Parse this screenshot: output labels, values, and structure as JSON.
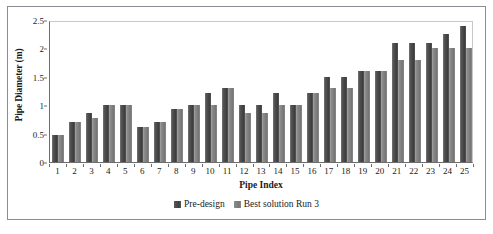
{
  "chart_data": {
    "type": "bar",
    "title": "",
    "xlabel": "Pipe Index",
    "ylabel": "Pipe Diameter (m)",
    "ylim": [
      0,
      2.5
    ],
    "yticks": [
      0,
      0.5,
      1,
      1.5,
      2,
      2.5
    ],
    "ytick_labels": [
      "0",
      "0.5",
      "1",
      "1.5",
      "2",
      "2.5"
    ],
    "grid": false,
    "legend_position": "bottom",
    "categories": [
      "1",
      "2",
      "3",
      "4",
      "5",
      "6",
      "7",
      "8",
      "9",
      "10",
      "11",
      "12",
      "13",
      "14",
      "15",
      "16",
      "17",
      "18",
      "19",
      "20",
      "21",
      "22",
      "23",
      "24",
      "25"
    ],
    "series": [
      {
        "name": "Pre-design",
        "color": "#4a4a4a",
        "values": [
          0.47,
          0.7,
          0.86,
          1.0,
          1.0,
          0.61,
          0.7,
          0.93,
          1.0,
          1.22,
          1.3,
          1.0,
          1.0,
          1.22,
          1.0,
          1.22,
          1.5,
          1.5,
          1.6,
          1.6,
          2.1,
          2.1,
          2.1,
          2.25,
          2.4
        ]
      },
      {
        "name": "Best solution Run 3",
        "color": "#808080",
        "values": [
          0.47,
          0.7,
          0.78,
          1.0,
          1.0,
          0.61,
          0.7,
          0.93,
          1.0,
          1.0,
          1.3,
          0.86,
          0.86,
          1.0,
          1.0,
          1.22,
          1.3,
          1.3,
          1.6,
          1.6,
          1.8,
          1.8,
          2.0,
          2.0,
          2.0
        ]
      }
    ]
  },
  "legend": {
    "items": [
      {
        "label": "Pre-design"
      },
      {
        "label": "Best solution Run 3"
      }
    ]
  }
}
